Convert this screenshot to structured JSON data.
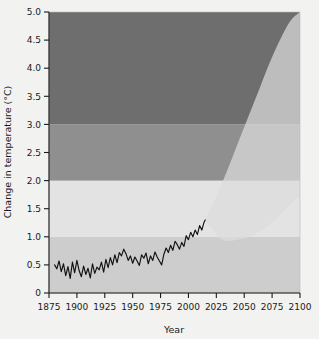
{
  "chart_data": {
    "type": "line",
    "title": "",
    "subtitle": "",
    "xlabel": "Year",
    "ylabel": "Change in temperature (°C)",
    "xlim": [
      1875,
      2100
    ],
    "ylim": [
      0,
      5.0
    ],
    "grid": false,
    "legend_position": "none",
    "x_ticks": [
      1875,
      1900,
      1925,
      1950,
      1975,
      2000,
      2025,
      2050,
      2075,
      2100
    ],
    "x_tick_labels": [
      "1875",
      "1900",
      "1925",
      "1950",
      "1975",
      "2000",
      "2025",
      "2050",
      "2075",
      "2100"
    ],
    "y_ticks": [
      0,
      0.5,
      1.0,
      1.5,
      2.0,
      2.5,
      3.0,
      3.5,
      4.0,
      4.5,
      5.0
    ],
    "y_tick_labels": [
      "0",
      "0.5",
      "1.0",
      "1.5",
      "2.0",
      "2.5",
      "3.0",
      "3.5",
      "4.0",
      "4.5",
      "5.0"
    ],
    "background_bands": [
      {
        "name": "below-1C-band",
        "from": 0.0,
        "to": 1.0,
        "color": "#cdcdcd"
      },
      {
        "name": "1-to-2C-band",
        "from": 1.0,
        "to": 2.0,
        "color": "#e3e3e3"
      },
      {
        "name": "2-to-3C-band",
        "from": 2.0,
        "to": 3.0,
        "color": "#8f8f8f"
      },
      {
        "name": "above-3C-band",
        "from": 3.0,
        "to": 5.0,
        "color": "#6e6e6e"
      }
    ],
    "series": [
      {
        "name": "Observed temperature change",
        "type": "line",
        "color": "#111111",
        "x": [
          1880,
          1882,
          1884,
          1886,
          1888,
          1890,
          1892,
          1894,
          1896,
          1898,
          1900,
          1902,
          1904,
          1906,
          1908,
          1910,
          1912,
          1914,
          1916,
          1918,
          1920,
          1922,
          1924,
          1926,
          1928,
          1930,
          1932,
          1934,
          1936,
          1938,
          1940,
          1942,
          1944,
          1946,
          1948,
          1950,
          1952,
          1954,
          1956,
          1958,
          1960,
          1962,
          1964,
          1966,
          1968,
          1970,
          1972,
          1974,
          1976,
          1978,
          1980,
          1982,
          1984,
          1986,
          1988,
          1990,
          1992,
          1994,
          1996,
          1998,
          2000,
          2002,
          2004,
          2006,
          2008,
          2010,
          2012,
          2014,
          2015
        ],
        "values": [
          0.5,
          0.43,
          0.57,
          0.38,
          0.52,
          0.31,
          0.47,
          0.26,
          0.55,
          0.36,
          0.58,
          0.4,
          0.29,
          0.48,
          0.33,
          0.44,
          0.27,
          0.52,
          0.35,
          0.46,
          0.41,
          0.55,
          0.37,
          0.6,
          0.45,
          0.63,
          0.5,
          0.68,
          0.54,
          0.72,
          0.66,
          0.78,
          0.7,
          0.58,
          0.66,
          0.53,
          0.64,
          0.57,
          0.49,
          0.68,
          0.62,
          0.71,
          0.52,
          0.66,
          0.58,
          0.73,
          0.64,
          0.57,
          0.5,
          0.69,
          0.8,
          0.72,
          0.85,
          0.76,
          0.92,
          0.86,
          0.78,
          0.9,
          0.83,
          1.02,
          0.95,
          1.08,
          1.0,
          1.12,
          1.04,
          1.2,
          1.12,
          1.26,
          1.3
        ]
      },
      {
        "name": "Projected warming range (upper bound)",
        "type": "envelope-upper",
        "color": "#dcdcdc",
        "x": [
          2015,
          2030,
          2045,
          2060,
          2075,
          2090,
          2100
        ],
        "values": [
          1.3,
          1.95,
          2.7,
          3.45,
          4.2,
          4.8,
          5.0
        ]
      },
      {
        "name": "Projected warming range (lower bound)",
        "type": "envelope-lower",
        "color": "#dcdcdc",
        "x": [
          2015,
          2030,
          2045,
          2060,
          2075,
          2090,
          2100
        ],
        "values": [
          1.3,
          0.95,
          0.95,
          1.05,
          1.25,
          1.55,
          1.72
        ]
      }
    ]
  },
  "axes": {
    "x_title": "Year",
    "y_title": "Change in temperature (°C)"
  },
  "colors": {
    "figure_background": "#f2f2f0",
    "band_above_3": "#6e6e6e",
    "band_2_to_3": "#8f8f8f",
    "band_1_to_2": "#e3e3e3",
    "band_below_1": "#cdcdcd",
    "projection_fill": "#dcdcdc",
    "observed_line": "#111111",
    "axis": "#1a1a1a"
  }
}
